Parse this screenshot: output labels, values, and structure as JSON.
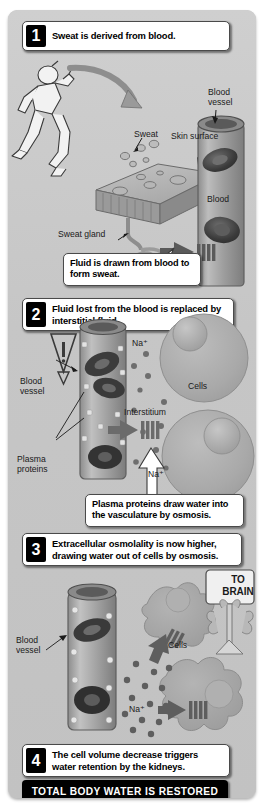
{
  "figure": {
    "background_color": "#c6c6c6",
    "page_background": "#ffffff"
  },
  "steps": [
    {
      "number": "1",
      "text": "Sweat is derived from blood."
    },
    {
      "number": "2",
      "text": "Fluid lost from the blood is replaced by interstitial fluid."
    },
    {
      "number": "3",
      "text": "Extracellular osmolality is now higher, drawing water out of cells by osmosis."
    },
    {
      "number": "4",
      "text": "The cell volume decrease triggers water retention by the kidneys."
    }
  ],
  "callouts": [
    {
      "id": "callout-sweat",
      "text": "Fluid is drawn from blood to form sweat."
    },
    {
      "id": "callout-osmosis",
      "text": "Plasma proteins draw water into the vasculature by osmosis."
    }
  ],
  "banner": {
    "text": "TOTAL BODY WATER IS RESTORED"
  },
  "panel1": {
    "labels": {
      "sweat": "Sweat",
      "skin_surface": "Skin surface",
      "blood_vessel": "Blood\nvessel",
      "sweat_gland": "Sweat gland",
      "blood": "Blood"
    },
    "icons": {
      "runner": "running-person-icon",
      "arrow_sweat": "curved-arrow-icon",
      "arrow_flow": "thick-left-arrow-icon"
    }
  },
  "panel2": {
    "labels": {
      "sodium_top": "Na⁺",
      "sodium_bottom": "Na⁺",
      "cells": "Cells",
      "interstitium": "Interstitium",
      "blood_vessel": "Blood\nvessel",
      "plasma_proteins": "Plasma\nproteins"
    },
    "icons": {
      "warning": "warning-triangle-icon",
      "arrow_flow": "thick-left-arrow-icon",
      "arrow_up": "hollow-up-arrow-icon"
    }
  },
  "panel3": {
    "labels": {
      "blood_vessel": "Blood\nvessel",
      "cells": "Cells",
      "sodium": "Na⁺",
      "to_brain": "TO\nBRAIN"
    },
    "icons": {
      "signpost": "signpost-icon",
      "nerve": "nerve-icon",
      "arrow_flow_upper": "thick-left-arrow-icon",
      "arrow_flow_lower": "thick-left-arrow-icon"
    }
  },
  "colors": {
    "panel": "#c6c6c6",
    "ink": "#000000",
    "callout_bg": "#ffffff",
    "banner_bg": "#000000",
    "banner_text": "#ffffff",
    "vessel": "#9f9f9f",
    "cell": "#adadad"
  }
}
